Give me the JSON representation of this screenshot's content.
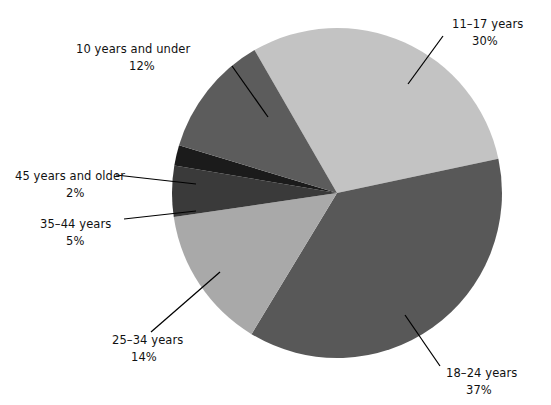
{
  "chart_data": {
    "type": "pie",
    "title": "",
    "subtitle": "",
    "xlabel": "",
    "ylabel": "",
    "legend_position": "none",
    "grid": false,
    "units": "percent",
    "total": 100,
    "categories": [
      "11–17 years",
      "18–24 years",
      "25–34 years",
      "35–44 years",
      "45 years and older",
      "10 years and under"
    ],
    "values": [
      30,
      37,
      14,
      5,
      2,
      12
    ],
    "slices": [
      {
        "label": "11–17 years",
        "value": 30,
        "pct_text": "30%",
        "color": "#c3c3c3",
        "start_deg": 330,
        "end_deg": 438,
        "label_x": 452,
        "label_y": 28,
        "pct_x": 472,
        "pct_y": 45,
        "leader": {
          "x1": 443,
          "y1": 36,
          "x2": 408,
          "y2": 84
        }
      },
      {
        "label": "18–24 years",
        "value": 37,
        "pct_text": "37%",
        "color": "#585858",
        "start_deg": 438,
        "end_deg": 571.2,
        "label_x": 446,
        "label_y": 377,
        "pct_x": 466,
        "pct_y": 394,
        "leader": {
          "x1": 440,
          "y1": 366,
          "x2": 405,
          "y2": 315
        }
      },
      {
        "label": "25–34 years",
        "value": 14,
        "pct_text": "14%",
        "color": "#a9a9a9",
        "start_deg": 571.2,
        "end_deg": 621.6,
        "label_x": 112,
        "label_y": 344,
        "pct_x": 131,
        "pct_y": 361,
        "leader": {
          "x1": 151,
          "y1": 332,
          "x2": 220,
          "y2": 272
        }
      },
      {
        "label": "35–44 years",
        "value": 5,
        "pct_text": "5%",
        "color": "#3a3a3a",
        "start_deg": 621.6,
        "end_deg": 639.6,
        "label_x": 40,
        "label_y": 228,
        "pct_x": 66,
        "pct_y": 245,
        "leader": {
          "x1": 124,
          "y1": 219,
          "x2": 196,
          "y2": 211
        }
      },
      {
        "label": "45 years and older",
        "value": 2,
        "pct_text": "2%",
        "color": "#1b1b1b",
        "start_deg": 639.6,
        "end_deg": 646.8,
        "label_x": 15,
        "label_y": 180,
        "pct_x": 66,
        "pct_y": 197,
        "leader": {
          "x1": 116,
          "y1": 175,
          "x2": 196,
          "y2": 184
        }
      },
      {
        "label": "10 years and under",
        "value": 12,
        "pct_text": "12%",
        "color": "#5c5c5c",
        "start_deg": 646.8,
        "end_deg": 690,
        "label_x": 76,
        "label_y": 53,
        "pct_x": 129,
        "pct_y": 70,
        "leader": {
          "x1": 232,
          "y1": 66,
          "x2": 268,
          "y2": 117
        }
      }
    ],
    "geometry": {
      "center_x": 337,
      "center_y": 193,
      "radius": 165
    },
    "palette": {
      "lightest": "#c3c3c3",
      "light": "#a9a9a9",
      "mid": "#5c5c5c",
      "dark": "#585858",
      "darker": "#3a3a3a",
      "darkest": "#1b1b1b",
      "background": "#ffffff",
      "text": "#111111",
      "leader": "#000000"
    }
  }
}
